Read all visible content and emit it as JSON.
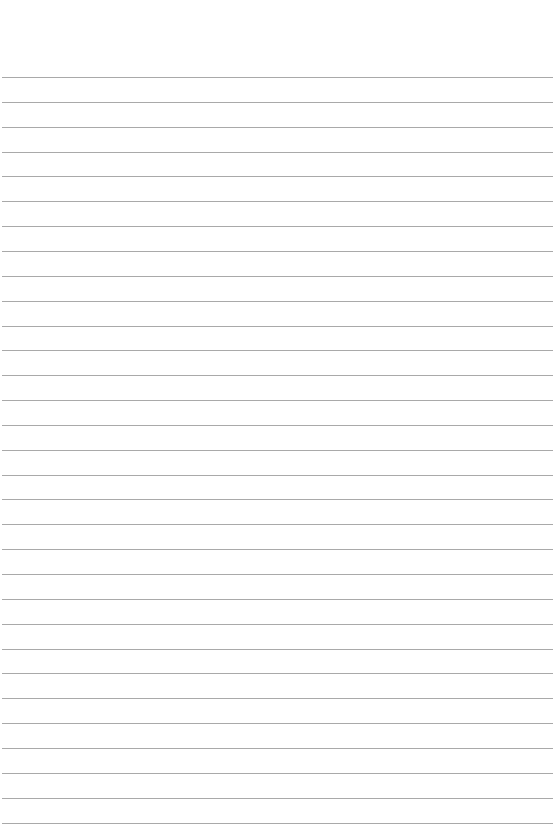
{
  "page": {
    "type": "blank lined paper",
    "line_color": "#a9a9a9",
    "background": "#ffffff",
    "line_count": 31,
    "first_line_y": 77,
    "line_spacing": 24.85
  }
}
